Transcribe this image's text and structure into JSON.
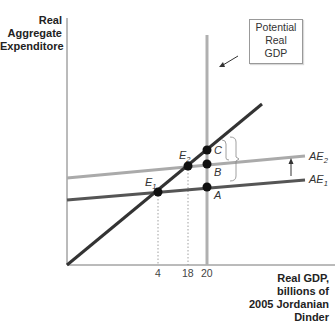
{
  "diagram": {
    "y_axis_label": [
      "Real",
      "Aggregate",
      "Expenditore"
    ],
    "x_axis_label": [
      "Real GDP,",
      "billions of",
      "2005 Jordanian",
      "Dinder"
    ],
    "potential_gdp_box": [
      "Potential",
      "Real",
      "GDP"
    ],
    "x_ticks": [
      "4",
      "18",
      "20"
    ],
    "curves": {
      "ae1": {
        "label": "AE",
        "sub": "1",
        "color": "#555555"
      },
      "ae2": {
        "label": "AE",
        "sub": "2",
        "color": "#aaaaaa"
      },
      "forty_five": {
        "color": "#333333"
      },
      "potential_gdp_line": {
        "color": "#b0b0b0"
      }
    },
    "points": {
      "e1": {
        "label": "E",
        "sub": "1"
      },
      "e2": {
        "label": "E",
        "sub": "2"
      },
      "a": {
        "label": "A"
      },
      "b": {
        "label": "B"
      },
      "c": {
        "label": "C"
      }
    }
  }
}
